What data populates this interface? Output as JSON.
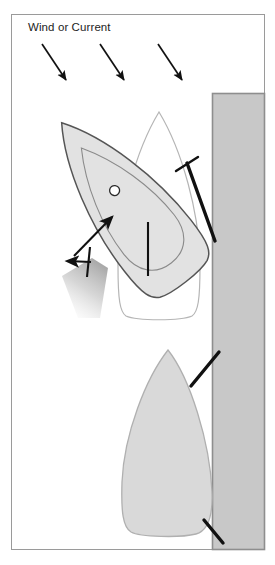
{
  "diagram": {
    "title_label": "Wind or Current",
    "colors": {
      "frame_border": "#9a9a9a",
      "dock_fill": "#c8c8c8",
      "dock_border": "#8e8e8e",
      "boat_rotated_fill": "#e2e2e2",
      "boat_rotated_stroke": "#555555",
      "boat_ghost_fill": "#ffffff",
      "boat_ghost_stroke": "#b5b5b5",
      "boat_moored_fill": "#d9d9d9",
      "boat_moored_stroke": "#b0b0b0",
      "line_black": "#111111",
      "wash_gray": "#b9b9b9",
      "cabin_stroke": "#8a8a8a",
      "text": "#1d1d1d"
    },
    "wind_arrows": [
      {
        "name": "wind-arrow-left",
        "x1": 42,
        "y1": 44,
        "x2": 66,
        "y2": 82
      },
      {
        "name": "wind-arrow-center",
        "x1": 100,
        "y1": 44,
        "x2": 124,
        "y2": 82
      },
      {
        "name": "wind-arrow-right",
        "x1": 158,
        "y1": 44,
        "x2": 182,
        "y2": 82
      }
    ],
    "dock": {
      "x": 212,
      "y": 93,
      "width": 53,
      "height": 457
    },
    "boat_rotated": {
      "label": "boat pivoted off dock",
      "rotation_deg": -38,
      "center_x": 122,
      "center_y": 200,
      "hull_width": 84,
      "hull_length": 196,
      "porthole": {
        "cx": 136,
        "cy": 188,
        "r": 5
      }
    },
    "boat_ghost": {
      "label": "original boat position",
      "bow_x": 159,
      "bow_y": 112,
      "stern_y": 318,
      "left_x": 118,
      "right_x": 200
    },
    "boat_moored": {
      "label": "boat moored alongside",
      "bow_x": 168,
      "bow_y": 350,
      "stern_y": 535,
      "left_x": 122,
      "right_x": 212
    },
    "spring_line": {
      "dock_x": 215,
      "dock_y": 241,
      "cleat_x": 187,
      "cleat_y": 163
    },
    "thrust_arrow": {
      "x1": 74,
      "y1": 254,
      "x2": 113,
      "y2": 216
    },
    "prop_wash_arrow": {
      "x1": 88,
      "y1": 264,
      "x2": 68,
      "y2": 262
    },
    "centerline_mark": {
      "x": 148,
      "y1": 222,
      "y2": 276
    },
    "mooring_lines": [
      {
        "name": "bow-line",
        "x1": 219,
        "y1": 352,
        "x2": 191,
        "y2": 386
      },
      {
        "name": "stern-line",
        "x1": 204,
        "y1": 520,
        "x2": 223,
        "y2": 543
      }
    ]
  }
}
